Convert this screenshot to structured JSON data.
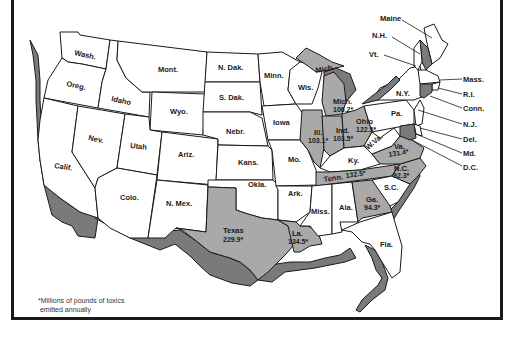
{
  "map": {
    "title": "Toxic emissions by state",
    "footnote": [
      "*Millions of pounds of toxics",
      " emitted annually"
    ],
    "colors": {
      "highlighted": "#a9a9a9",
      "relief_shadow": "#7a7a7a",
      "default": "#ffffff",
      "border": "#1a1a1a"
    },
    "states": [
      {
        "id": "wash",
        "label": "Wash."
      },
      {
        "id": "oreg",
        "label": "Oreg."
      },
      {
        "id": "calif",
        "label": "Calif."
      },
      {
        "id": "idaho",
        "label": "Idaho"
      },
      {
        "id": "nev",
        "label": "Nev."
      },
      {
        "id": "mont",
        "label": "Mont."
      },
      {
        "id": "wyo",
        "label": "Wyo."
      },
      {
        "id": "utah",
        "label": "Utah"
      },
      {
        "id": "ariz",
        "label": "Ariz."
      },
      {
        "id": "colo",
        "label": "Colo."
      },
      {
        "id": "nmex",
        "label": "N. Mex."
      },
      {
        "id": "ndak",
        "label": "N. Dak."
      },
      {
        "id": "sdak",
        "label": "S. Dak."
      },
      {
        "id": "nebr",
        "label": "Nebr."
      },
      {
        "id": "kans",
        "label": "Kans."
      },
      {
        "id": "okla",
        "label": "Okla."
      },
      {
        "id": "texas",
        "label": "Texas",
        "value": "229.9*"
      },
      {
        "id": "minn",
        "label": "Minn."
      },
      {
        "id": "iowa",
        "label": "Iowa"
      },
      {
        "id": "mo",
        "label": "Mo."
      },
      {
        "id": "ark",
        "label": "Ark."
      },
      {
        "id": "la",
        "label": "La.",
        "value": "134.5*"
      },
      {
        "id": "wis",
        "label": "Wis."
      },
      {
        "id": "ill",
        "label": "Ill.",
        "value": "103.1*"
      },
      {
        "id": "mich_up",
        "label": "Mich."
      },
      {
        "id": "mich",
        "label": "Mich.",
        "value": "106.2*"
      },
      {
        "id": "ind",
        "label": "Ind.",
        "value": "103.5*"
      },
      {
        "id": "ohio",
        "label": "Ohio",
        "value": "122.5*"
      },
      {
        "id": "ky",
        "label": "Ky."
      },
      {
        "id": "tenn",
        "label": "Tenn.",
        "value": "132.5*"
      },
      {
        "id": "miss",
        "label": "Miss."
      },
      {
        "id": "ala",
        "label": "Ala."
      },
      {
        "id": "ga",
        "label": "Ga.",
        "value": "94.3*"
      },
      {
        "id": "fla",
        "label": "Fla."
      },
      {
        "id": "sc",
        "label": "S.C."
      },
      {
        "id": "nc",
        "label": "N.C.",
        "value": "92.3*"
      },
      {
        "id": "va",
        "label": "Va.",
        "value": "131.4*"
      },
      {
        "id": "wva",
        "label": "W.Va."
      },
      {
        "id": "pa",
        "label": "Pa."
      },
      {
        "id": "ny",
        "label": "N.Y."
      },
      {
        "id": "maine",
        "label": "Maine"
      },
      {
        "id": "nh",
        "label": "N.H."
      },
      {
        "id": "vt",
        "label": "Vt."
      },
      {
        "id": "mass",
        "label": "Mass."
      },
      {
        "id": "ri",
        "label": "R.I."
      },
      {
        "id": "conn",
        "label": "Conn."
      },
      {
        "id": "nj",
        "label": "N.J."
      },
      {
        "id": "del",
        "label": "Del."
      },
      {
        "id": "md",
        "label": "Md."
      },
      {
        "id": "dc",
        "label": "D.C."
      }
    ]
  }
}
